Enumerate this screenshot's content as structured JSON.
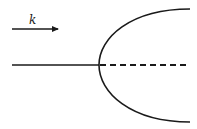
{
  "diagram": {
    "wave_vector_label": "k",
    "colors": {
      "stroke": "#1a1a1a",
      "background": "#ffffff"
    },
    "elements": {
      "incident_arrow": {
        "x1": 12,
        "y1": 29,
        "x2": 60,
        "y2": 29,
        "direction": "right"
      },
      "axis_solid": {
        "x1": 12,
        "y1": 65,
        "x2": 99,
        "y2": 65
      },
      "axis_dashed": {
        "x1": 99,
        "y1": 65,
        "x2": 188,
        "y2": 65
      },
      "parabola": {
        "vertex_x": 99,
        "vertex_y": 65,
        "top_end": [
          190,
          9
        ],
        "bottom_end": [
          190,
          122
        ]
      }
    }
  }
}
